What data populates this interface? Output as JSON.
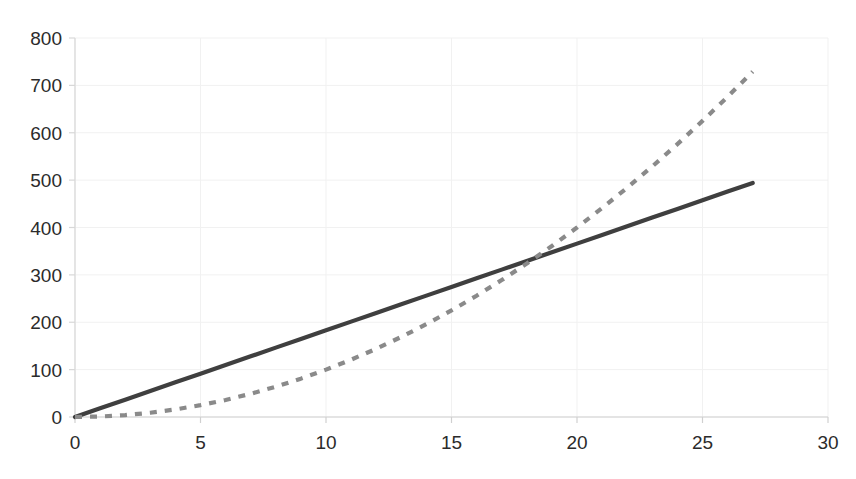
{
  "chart_data": {
    "type": "line",
    "title": "",
    "subtitle": "",
    "xlabel": "",
    "ylabel": "",
    "xlim": [
      0,
      30
    ],
    "ylim": [
      0,
      800
    ],
    "x_ticks": [
      0,
      5,
      10,
      15,
      20,
      25,
      30
    ],
    "y_ticks": [
      0,
      100,
      200,
      300,
      400,
      500,
      600,
      700,
      800
    ],
    "grid": true,
    "legend": "none",
    "x": [
      0,
      1,
      2,
      3,
      4,
      5,
      6,
      7,
      8,
      9,
      10,
      11,
      12,
      13,
      14,
      15,
      16,
      17,
      18,
      19,
      20,
      21,
      22,
      23,
      24,
      25,
      26,
      27
    ],
    "series": [
      {
        "name": "linear",
        "style": "solid",
        "color": "#3f3f3f",
        "values": [
          0,
          18.3,
          36.6,
          54.9,
          73.2,
          91.5,
          109.8,
          128.1,
          146.4,
          164.7,
          183,
          201.3,
          219.6,
          237.9,
          256.2,
          274.5,
          292.8,
          311.1,
          329.4,
          347.7,
          366,
          384.3,
          402.6,
          420.9,
          439.2,
          457.5,
          475.8,
          494
        ]
      },
      {
        "name": "quadratic",
        "style": "dashed",
        "color": "#8a8a8a",
        "values": [
          0,
          1,
          4,
          9,
          16,
          25,
          36,
          49,
          64,
          81,
          100,
          121,
          144,
          169,
          196,
          225,
          256,
          289,
          324,
          361,
          400,
          441,
          484,
          529,
          576,
          625,
          676,
          729
        ]
      }
    ],
    "annotations": [],
    "x_tick_labels": [
      "0",
      "5",
      "10",
      "15",
      "20",
      "25",
      "30"
    ],
    "y_tick_labels": [
      "0",
      "100",
      "200",
      "300",
      "400",
      "500",
      "600",
      "700",
      "800"
    ]
  },
  "plot_geometry": {
    "left_px": 75,
    "right_px": 828,
    "top_px": 38,
    "bottom_px": 417
  }
}
